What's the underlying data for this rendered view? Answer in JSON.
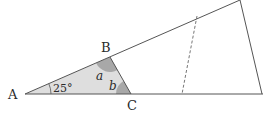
{
  "diagram": {
    "type": "geometry",
    "points": {
      "A": {
        "label": "A",
        "x": 25,
        "y": 94
      },
      "B": {
        "label": "B",
        "x": 110,
        "y": 57
      },
      "C": {
        "label": "C",
        "x": 131,
        "y": 94
      },
      "apex": {
        "x": 240,
        "y": 0
      },
      "base_right": {
        "x": 262,
        "y": 94
      },
      "dash_top": {
        "x": 197,
        "y": 16
      },
      "dash_bottom": {
        "x": 182,
        "y": 94
      }
    },
    "labels": {
      "A": "A",
      "B": "B",
      "C": "C",
      "angle_A": "25°",
      "angle_a": "a",
      "angle_b": "b"
    },
    "colors": {
      "line": "#555555",
      "fill": "#d9d9d9",
      "angle_fill": "#a9a9a9",
      "dashed": "#777777",
      "text": "#2a2a2a"
    }
  }
}
